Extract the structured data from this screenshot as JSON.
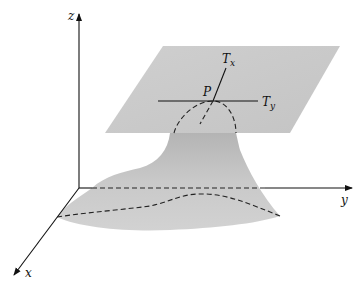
{
  "figure": {
    "labels": {
      "z_axis": "z",
      "y_axis": "y",
      "x_axis": "x",
      "point": "P",
      "tangent_x_main": "T",
      "tangent_x_sub": "x",
      "tangent_y_main": "T",
      "tangent_y_sub": "y"
    },
    "colors": {
      "plane": "#c8c8c8",
      "surface": "#bdbdbd",
      "surface_light": "#d6d6d6",
      "lines": "#111111",
      "background": "#ffffff"
    }
  }
}
